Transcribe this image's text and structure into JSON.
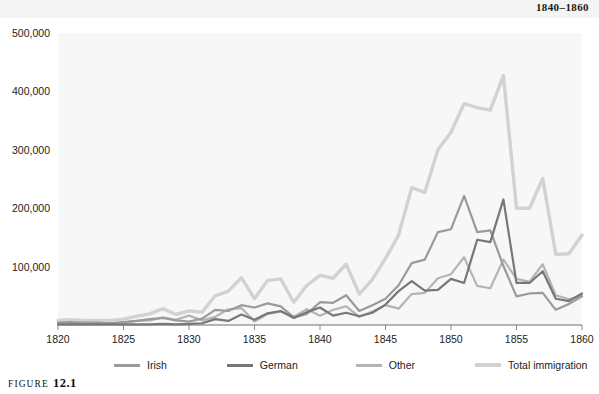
{
  "header": {
    "running_head": "1840–1860"
  },
  "figure": {
    "label_word": "Figure",
    "number": "12.1"
  },
  "legend": {
    "position": "bottom",
    "items": [
      {
        "label": "Irish",
        "color": "#9a9a9a"
      },
      {
        "label": "German",
        "color": "#777777"
      },
      {
        "label": "Other",
        "color": "#b4b4b4"
      },
      {
        "label": "Total immigration",
        "color": "#d2d2d2"
      }
    ]
  },
  "chart_data": {
    "type": "line",
    "title": "",
    "subtitle": "",
    "xlabel": "",
    "ylabel": "",
    "xlim": [
      1820,
      1860
    ],
    "ylim": [
      0,
      500000
    ],
    "grid": false,
    "plot_background": "#f7f7f7",
    "x_ticks": [
      1820,
      1825,
      1830,
      1835,
      1840,
      1845,
      1850,
      1855,
      1860
    ],
    "x_tick_labels": [
      "1820",
      "1825",
      "1830",
      "1835",
      "1840",
      "1845",
      "1850",
      "1855",
      "1860"
    ],
    "y_ticks": [
      100000,
      200000,
      300000,
      400000,
      500000
    ],
    "y_tick_labels": [
      "100,000",
      "200,000",
      "300,000",
      "400,000",
      "500,000"
    ],
    "x": [
      1820,
      1821,
      1822,
      1823,
      1824,
      1825,
      1826,
      1827,
      1828,
      1829,
      1830,
      1831,
      1832,
      1833,
      1834,
      1835,
      1836,
      1837,
      1838,
      1839,
      1840,
      1841,
      1842,
      1843,
      1844,
      1845,
      1846,
      1847,
      1848,
      1849,
      1850,
      1851,
      1852,
      1853,
      1854,
      1855,
      1856,
      1857,
      1858,
      1859,
      1860
    ],
    "series": [
      {
        "name": "Irish",
        "color": "#9a9a9a",
        "width": 2.2,
        "values": [
          4000,
          5000,
          4000,
          4000,
          3000,
          5000,
          7000,
          10000,
          12000,
          8000,
          6000,
          11000,
          26000,
          24000,
          34000,
          30000,
          37000,
          32000,
          13000,
          19000,
          39000,
          38000,
          51000,
          24000,
          34000,
          45000,
          68000,
          106000,
          112000,
          159000,
          164000,
          221000,
          159000,
          162000,
          101000,
          49000,
          54000,
          55000,
          26000,
          36000,
          49000
        ]
      },
      {
        "name": "German",
        "color": "#777777",
        "width": 2.2,
        "values": [
          1000,
          1000,
          1000,
          1000,
          1000,
          1000,
          1000,
          1000,
          2000,
          1000,
          2000,
          3000,
          10000,
          7000,
          18000,
          9000,
          20000,
          24000,
          12000,
          22000,
          30000,
          16000,
          21000,
          15000,
          21000,
          35000,
          58000,
          75000,
          59000,
          60000,
          79000,
          72000,
          146000,
          142000,
          215000,
          72000,
          72000,
          92000,
          45000,
          41000,
          54000
        ]
      },
      {
        "name": "Other",
        "color": "#b4b4b4",
        "width": 2.2,
        "values": [
          3000,
          3000,
          3000,
          3000,
          3000,
          4000,
          7000,
          8000,
          13000,
          9000,
          16000,
          8000,
          14000,
          27000,
          29000,
          6000,
          19000,
          23000,
          14000,
          27000,
          16000,
          26000,
          32000,
          14000,
          23000,
          34000,
          28000,
          53000,
          55000,
          80000,
          87000,
          116000,
          67000,
          63000,
          112000,
          79000,
          74000,
          104000,
          51000,
          44000,
          50000
        ]
      },
      {
        "name": "Total immigration",
        "color": "#d2d2d2",
        "width": 3.4,
        "values": [
          8000,
          9000,
          8000,
          8000,
          8000,
          10000,
          15000,
          19000,
          28000,
          18000,
          24000,
          22000,
          50000,
          58000,
          81000,
          45000,
          76000,
          79000,
          39000,
          68000,
          85000,
          80000,
          104000,
          53000,
          78000,
          114000,
          154000,
          235000,
          227000,
          300000,
          330000,
          379000,
          372000,
          368000,
          427000,
          200000,
          200000,
          251000,
          121000,
          122000,
          154000
        ]
      }
    ]
  }
}
